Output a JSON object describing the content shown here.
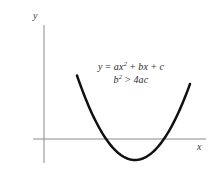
{
  "figure": {
    "background_color": "#ffffff",
    "width": 218,
    "height": 183
  },
  "axes": {
    "y_label": "y",
    "x_label": "x",
    "axis_color": "#8a8a8a",
    "origin": {
      "x": 44,
      "y": 139
    },
    "x_axis": {
      "start_x": 33,
      "end_x": 206,
      "y": 139
    },
    "y_axis": {
      "x": 44,
      "start_y": 25,
      "end_y": 163
    },
    "ticks": [],
    "grid": false
  },
  "annotation": {
    "line1": {
      "lhs": "y",
      "equals": "=",
      "term1_coef": "a",
      "term1_var": "x",
      "term1_exp": "2",
      "plus1": "+",
      "term2_coef": "b",
      "term2_var": "x",
      "plus2": "+",
      "term3": "c",
      "full_text": "y = ax2 + bx + c"
    },
    "line2": {
      "lhs_var": "b",
      "lhs_exp": "2",
      "relation": ">",
      "rhs": "4ac",
      "full_text": "b2 > 4ac"
    },
    "text_color": "#2b2b2b"
  },
  "chart_data": {
    "type": "line",
    "title": "",
    "subtitle": "",
    "xlabel": "x",
    "ylabel": "y",
    "grid": false,
    "legend": null,
    "curve_color": "#111111",
    "curve_width": 2.5,
    "annotations": [
      "y = ax^2 + bx + c",
      "b^2 > 4ac"
    ],
    "curve": {
      "vertex_px": [
        135,
        160
      ],
      "x_intercepts_px": [
        107,
        163
      ],
      "left_endpoint_px": [
        77,
        84
      ],
      "right_endpoint_px": [
        190,
        84
      ],
      "opens": "up",
      "discriminant_sign": "positive",
      "real_roots": 2
    },
    "series": [
      {
        "name": "y = ax^2 + bx + c",
        "points_px": [
          [
            77,
            84
          ],
          [
            83,
            96
          ],
          [
            89,
            107
          ],
          [
            95,
            117
          ],
          [
            101,
            127
          ],
          [
            107,
            139
          ],
          [
            113,
            146
          ],
          [
            119,
            152
          ],
          [
            125,
            156
          ],
          [
            131,
            159
          ],
          [
            135,
            160
          ],
          [
            141,
            159
          ],
          [
            147,
            156
          ],
          [
            153,
            150
          ],
          [
            158,
            145
          ],
          [
            163,
            139
          ],
          [
            169,
            128
          ],
          [
            175,
            116
          ],
          [
            181,
            104
          ],
          [
            186,
            93
          ],
          [
            190,
            84
          ]
        ]
      }
    ],
    "xlim_px": [
      33,
      206
    ],
    "ylim_px": [
      25,
      163
    ]
  }
}
